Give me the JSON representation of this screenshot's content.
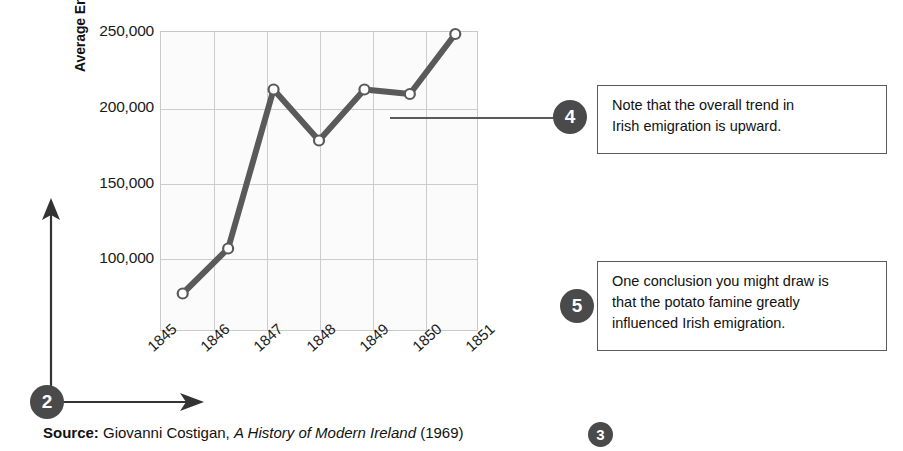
{
  "chart_data": {
    "type": "line",
    "title": "",
    "xlabel": "",
    "ylabel": "Average Emigration",
    "categories": [
      "1845",
      "1846",
      "1847",
      "1848",
      "1849",
      "1850",
      "1851"
    ],
    "values": [
      75000,
      105000,
      211000,
      177000,
      211000,
      208000,
      248000
    ],
    "series": [
      {
        "name": "Average Emigration",
        "values": [
          75000,
          105000,
          211000,
          177000,
          211000,
          208000,
          248000
        ]
      }
    ],
    "ylim": [
      50000,
      250000
    ],
    "yticks": [
      100000,
      150000,
      200000,
      250000
    ],
    "ytick_labels": [
      "100,000",
      "150,000",
      "200,000",
      "250,000"
    ],
    "grid": true,
    "legend": false,
    "line_color": "#5a5a5a",
    "marker": "open-circle",
    "plot_background": "#fbfbfb",
    "grid_color": "#cccccc"
  },
  "axis_title": {
    "y": "Average Emigration"
  },
  "annotations": [
    {
      "number": "2",
      "kind": "axis-arrows-badge",
      "text": ""
    },
    {
      "number": "3",
      "kind": "source-badge",
      "text": ""
    },
    {
      "number": "4",
      "kind": "callout",
      "lines": [
        "Note that the overall trend in",
        "Irish emigration is upward."
      ]
    },
    {
      "number": "5",
      "kind": "callout",
      "lines": [
        "One conclusion you might draw is",
        "that the potato famine greatly",
        "influenced Irish emigration."
      ]
    }
  ],
  "callout4": {
    "number": "4",
    "line1": "Note that the overall trend in",
    "line2": "Irish emigration is upward."
  },
  "callout5": {
    "number": "5",
    "line1": "One conclusion you might draw is",
    "line2": "that the potato famine greatly",
    "line3": "influenced Irish emigration."
  },
  "badges": {
    "two": "2",
    "three": "3"
  },
  "source": {
    "label": "Source:",
    "author": "Giovanni Costigan,",
    "work": "A History of Modern Ireland",
    "year": "(1969)"
  },
  "colors": {
    "badge": "#4a4a4a",
    "line": "#5a5a5a",
    "grid": "#cccccc",
    "border": "#5a5a5a"
  }
}
